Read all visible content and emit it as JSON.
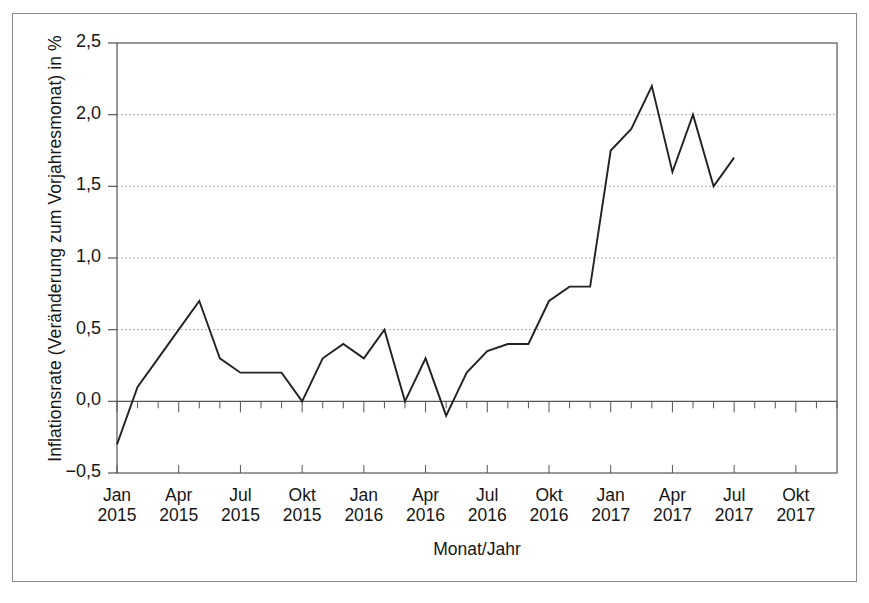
{
  "figure": {
    "background": "#ffffff",
    "frame_color": "#8a8a8a"
  },
  "chart_data": {
    "type": "line",
    "title": "",
    "xlabel": "Monat/Jahr",
    "ylabel": "Inflationsrate (Veränderung zum Vorjahresmonat) in %",
    "ylim": [
      -0.5,
      2.5
    ],
    "ytick_labels": [
      "2,5",
      "2,0",
      "1,5",
      "1,0",
      "0,5",
      "0,0",
      "−0,5"
    ],
    "ytick_values": [
      2.5,
      2.0,
      1.5,
      1.0,
      0.5,
      0.0,
      -0.5
    ],
    "grid": "horizontal-dotted",
    "legend": "none",
    "line_color": "#222222",
    "xtick_labels": [
      {
        "month": "Jan",
        "year": "2015"
      },
      {
        "month": "Apr",
        "year": "2015"
      },
      {
        "month": "Jul",
        "year": "2015"
      },
      {
        "month": "Okt",
        "year": "2015"
      },
      {
        "month": "Jan",
        "year": "2016"
      },
      {
        "month": "Apr",
        "year": "2016"
      },
      {
        "month": "Jul",
        "year": "2016"
      },
      {
        "month": "Okt",
        "year": "2016"
      },
      {
        "month": "Jan",
        "year": "2017"
      },
      {
        "month": "Apr",
        "year": "2017"
      },
      {
        "month": "Jul",
        "year": "2017"
      },
      {
        "month": "Okt",
        "year": "2017"
      }
    ],
    "xtick_months": [
      0,
      3,
      6,
      9,
      12,
      15,
      18,
      21,
      24,
      27,
      30,
      33
    ],
    "x_range_months": [
      0,
      35
    ],
    "x": [
      "Jan 2015",
      "Feb 2015",
      "Mrz 2015",
      "Apr 2015",
      "Mai 2015",
      "Jun 2015",
      "Jul 2015",
      "Aug 2015",
      "Sep 2015",
      "Okt 2015",
      "Nov 2015",
      "Dez 2015",
      "Jan 2016",
      "Feb 2016",
      "Mrz 2016",
      "Apr 2016",
      "Mai 2016",
      "Jun 2016",
      "Jul 2016",
      "Aug 2016",
      "Sep 2016",
      "Okt 2016",
      "Nov 2016",
      "Dez 2016",
      "Jan 2017",
      "Feb 2017",
      "Mrz 2017",
      "Apr 2017",
      "Mai 2017",
      "Jun 2017",
      "Jul 2017"
    ],
    "values": [
      -0.3,
      0.1,
      0.3,
      0.5,
      0.7,
      0.3,
      0.2,
      0.2,
      0.2,
      0.0,
      0.3,
      0.4,
      0.3,
      0.5,
      0.0,
      0.3,
      -0.1,
      0.2,
      0.35,
      0.4,
      0.4,
      0.7,
      0.8,
      0.8,
      1.75,
      1.9,
      2.2,
      1.6,
      2.0,
      1.5,
      1.7
    ]
  }
}
